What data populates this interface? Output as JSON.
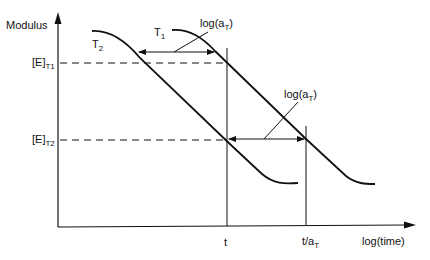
{
  "diagram": {
    "y_axis_label": "Modulus",
    "x_axis_label": "log(time)",
    "y_ticks": {
      "e_t1": {
        "base": "[E]",
        "sub": "T1"
      },
      "e_t2": {
        "base": "[E]",
        "sub": "T2"
      }
    },
    "x_ticks": {
      "t": "t",
      "t_over_at": {
        "base": "t/a",
        "sub": "T"
      }
    },
    "curves": {
      "t1": {
        "base": "T",
        "sub": "1"
      },
      "t2": {
        "base": "T",
        "sub": "2"
      }
    },
    "shift_labels": {
      "upper": {
        "base": "log(a",
        "sub": "T",
        "close": ")"
      },
      "lower": {
        "base": "log(a",
        "sub": "T",
        "close": ")"
      }
    },
    "colors": {
      "line": "#111111",
      "background": "#ffffff"
    }
  }
}
